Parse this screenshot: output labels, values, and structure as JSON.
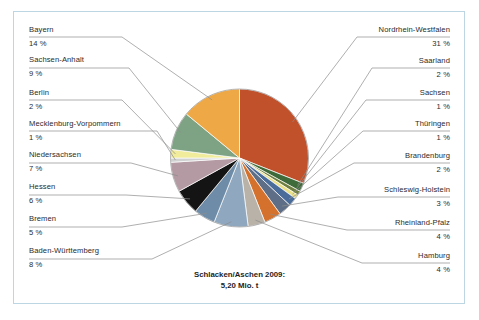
{
  "figure": {
    "caption_line1": "Schlacken/Aschen 2009:",
    "caption_line2": "5,20 Mio. t",
    "frame_color": "#bcd6e3",
    "background": "#ffffff"
  },
  "chart_data": {
    "type": "pie",
    "title": "Schlacken/Aschen 2009: 5,20 Mio. t",
    "unit": "%",
    "total_label": "5,20 Mio. t",
    "year": "2009",
    "legend_position": "callout-labels",
    "categories": [
      "Nordrhein-Westfalen",
      "Saarland",
      "Sachsen",
      "Thüringen",
      "Brandenburg",
      "Schleswig-Holstein",
      "Rheinland-Pfalz",
      "Hamburg",
      "Baden-Württemberg",
      "Bremen",
      "Hessen",
      "Niedersachsen",
      "Mecklenburg-Vorpommern",
      "Berlin",
      "Sachsen-Anhalt",
      "Bayern"
    ],
    "values": [
      31,
      2,
      1,
      1,
      2,
      3,
      4,
      4,
      8,
      5,
      6,
      7,
      1,
      2,
      9,
      14
    ],
    "labels": [
      "31 %",
      "2 %",
      "1 %",
      "1 %",
      "2 %",
      "3 %",
      "4 %",
      "4 %",
      "8 %",
      "5 %",
      "6 %",
      "7 %",
      "1 %",
      "2 %",
      "9 %",
      "14 %"
    ],
    "colors": [
      "#c1512a",
      "#3f6b3a",
      "#6f7f3f",
      "#e9e08a",
      "#4a6c9b",
      "#5d6e86",
      "#d4712c",
      "#b8b2a8",
      "#8fa8bf",
      "#6e8ca8",
      "#141414",
      "#b49aa2",
      "#cfd2d0",
      "#f0ec9c",
      "#7ea384",
      "#efa846"
    ]
  },
  "callouts": {
    "left": [
      {
        "name": "Bayern",
        "pct": "14 %"
      },
      {
        "name": "Sachsen-Anhalt",
        "pct": "9 %"
      },
      {
        "name": "Berlin",
        "pct": "2 %"
      },
      {
        "name": "Mecklenburg-Vorpommern",
        "pct": "1 %"
      },
      {
        "name": "Niedersachsen",
        "pct": "7 %"
      },
      {
        "name": "Hessen",
        "pct": "6 %"
      },
      {
        "name": "Bremen",
        "pct": "5 %"
      },
      {
        "name": "Baden-Württemberg",
        "pct": "8 %"
      }
    ],
    "right": [
      {
        "name": "Nordrhein-Westfalen",
        "pct": "31 %"
      },
      {
        "name": "Saarland",
        "pct": "2 %"
      },
      {
        "name": "Sachsen",
        "pct": "1 %"
      },
      {
        "name": "Thüringen",
        "pct": "1 %"
      },
      {
        "name": "Brandenburg",
        "pct": "2 %"
      },
      {
        "name": "Schleswig-Holstein",
        "pct": "3 %"
      },
      {
        "name": "Rheinland-Pfalz",
        "pct": "4 %"
      },
      {
        "name": "Hamburg",
        "pct": "4 %"
      }
    ]
  }
}
